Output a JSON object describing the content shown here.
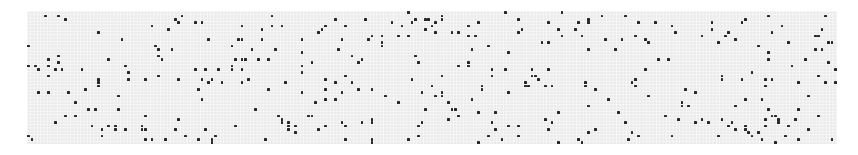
{
  "board": {
    "columns": 243,
    "rows": 40,
    "cell_size_px": 3.333,
    "background_color": "#ebebeb",
    "live_color": "#262626",
    "page_color": "#ffffff"
  },
  "live_cells": [
    [
      5,
      1
    ],
    [
      9,
      1
    ],
    [
      11,
      2
    ],
    [
      21,
      6
    ],
    [
      28,
      8
    ],
    [
      37,
      4
    ],
    [
      44,
      2
    ],
    [
      45,
      3
    ],
    [
      46,
      1
    ],
    [
      50,
      3
    ],
    [
      52,
      3
    ],
    [
      42,
      5
    ],
    [
      54,
      8
    ],
    [
      64,
      4
    ],
    [
      70,
      5
    ],
    [
      73,
      1
    ],
    [
      73,
      4
    ],
    [
      76,
      4
    ],
    [
      0,
      10
    ],
    [
      38,
      10
    ],
    [
      39,
      11
    ],
    [
      43,
      11
    ],
    [
      61,
      10
    ],
    [
      63,
      8
    ],
    [
      64,
      8
    ],
    [
      70,
      8
    ],
    [
      74,
      11
    ],
    [
      67,
      11
    ],
    [
      0,
      16
    ],
    [
      2,
      16
    ],
    [
      3,
      17
    ],
    [
      6,
      14
    ],
    [
      9,
      13
    ],
    [
      9,
      15
    ],
    [
      6,
      16
    ],
    [
      8,
      17
    ],
    [
      10,
      17
    ],
    [
      16,
      17
    ],
    [
      24,
      14
    ],
    [
      29,
      16
    ],
    [
      30,
      18
    ],
    [
      39,
      13
    ],
    [
      40,
      14
    ],
    [
      50,
      17
    ],
    [
      53,
      17
    ],
    [
      57,
      17
    ],
    [
      61,
      16
    ],
    [
      61,
      17
    ],
    [
      62,
      14
    ],
    [
      64,
      14
    ],
    [
      65,
      14
    ],
    [
      64,
      17
    ],
    [
      69,
      14
    ],
    [
      72,
      14
    ],
    [
      6,
      19
    ],
    [
      21,
      20
    ],
    [
      21,
      21
    ],
    [
      21,
      22
    ],
    [
      30,
      20
    ],
    [
      35,
      20
    ],
    [
      39,
      19
    ],
    [
      45,
      20
    ],
    [
      55,
      20
    ],
    [
      52,
      20
    ],
    [
      54,
      21
    ],
    [
      58,
      21
    ],
    [
      64,
      21
    ],
    [
      66,
      20
    ],
    [
      77,
      21
    ],
    [
      51,
      23
    ],
    [
      72,
      23
    ],
    [
      17,
      23
    ],
    [
      3,
      24
    ],
    [
      6,
      24
    ],
    [
      12,
      24
    ],
    [
      27,
      25
    ],
    [
      52,
      26
    ],
    [
      14,
      27
    ],
    [
      18,
      29
    ],
    [
      20,
      29
    ],
    [
      27,
      29
    ],
    [
      68,
      29
    ],
    [
      11,
      31
    ],
    [
      14,
      31
    ],
    [
      35,
      31
    ],
    [
      45,
      32
    ],
    [
      75,
      31
    ],
    [
      76,
      33
    ],
    [
      8,
      33
    ],
    [
      19,
      34
    ],
    [
      24,
      34
    ],
    [
      26,
      34
    ],
    [
      26,
      35
    ],
    [
      22,
      35
    ],
    [
      29,
      35
    ],
    [
      34,
      34
    ],
    [
      34,
      35
    ],
    [
      35,
      35
    ],
    [
      44,
      35
    ],
    [
      53,
      35
    ],
    [
      62,
      34
    ],
    [
      78,
      34
    ],
    [
      78,
      35
    ],
    [
      56,
      37
    ],
    [
      22,
      37
    ],
    [
      0,
      37
    ],
    [
      1,
      38
    ],
    [
      23,
      40
    ],
    [
      35,
      38
    ],
    [
      37,
      38
    ],
    [
      41,
      38
    ],
    [
      47,
      37
    ],
    [
      51,
      38
    ],
    [
      55,
      38
    ],
    [
      55,
      39
    ],
    [
      71,
      38
    ],
    [
      92,
      2
    ],
    [
      101,
      2
    ],
    [
      114,
      0
    ],
    [
      116,
      2
    ],
    [
      119,
      2
    ],
    [
      120,
      2
    ],
    [
      124,
      1
    ],
    [
      124,
      2
    ],
    [
      109,
      3
    ],
    [
      112,
      4
    ],
    [
      115,
      3
    ],
    [
      121,
      4
    ],
    [
      122,
      3
    ],
    [
      119,
      5
    ],
    [
      122,
      6
    ],
    [
      127,
      6
    ],
    [
      129,
      6
    ],
    [
      132,
      4
    ],
    [
      135,
      3
    ],
    [
      143,
      0
    ],
    [
      147,
      2
    ],
    [
      156,
      3
    ],
    [
      160,
      0
    ],
    [
      159,
      5
    ],
    [
      160,
      7
    ],
    [
      148,
      5
    ],
    [
      147,
      6
    ],
    [
      89,
      4
    ],
    [
      88,
      5
    ],
    [
      87,
      6
    ],
    [
      95,
      4
    ],
    [
      82,
      8
    ],
    [
      94,
      8
    ],
    [
      103,
      7
    ],
    [
      102,
      8
    ],
    [
      106,
      7
    ],
    [
      106,
      9
    ],
    [
      106,
      10
    ],
    [
      111,
      7
    ],
    [
      114,
      7
    ],
    [
      132,
      7
    ],
    [
      134,
      7
    ],
    [
      133,
      11
    ],
    [
      138,
      10
    ],
    [
      144,
      12
    ],
    [
      154,
      9
    ],
    [
      156,
      9
    ],
    [
      82,
      12
    ],
    [
      93,
      11
    ],
    [
      97,
      13
    ],
    [
      100,
      14
    ],
    [
      99,
      15
    ],
    [
      116,
      13
    ],
    [
      117,
      15
    ],
    [
      129,
      16
    ],
    [
      132,
      16
    ],
    [
      132,
      15
    ],
    [
      82,
      16
    ],
    [
      85,
      15
    ],
    [
      82,
      18
    ],
    [
      139,
      17
    ],
    [
      139,
      19
    ],
    [
      143,
      17
    ],
    [
      151,
      17
    ],
    [
      151,
      19
    ],
    [
      152,
      19
    ],
    [
      153,
      20
    ],
    [
      156,
      17
    ],
    [
      77,
      21
    ],
    [
      89,
      20
    ],
    [
      92,
      21
    ],
    [
      95,
      19
    ],
    [
      97,
      21
    ],
    [
      115,
      20
    ],
    [
      124,
      19
    ],
    [
      121,
      22
    ],
    [
      149,
      21
    ],
    [
      149,
      22
    ],
    [
      150,
      22
    ],
    [
      155,
      22
    ],
    [
      157,
      22
    ],
    [
      136,
      22
    ],
    [
      136,
      23
    ],
    [
      89,
      23
    ],
    [
      94,
      24
    ],
    [
      99,
      23
    ],
    [
      103,
      23
    ],
    [
      82,
      24
    ],
    [
      118,
      24
    ],
    [
      122,
      25
    ],
    [
      124,
      24
    ],
    [
      124,
      25
    ],
    [
      144,
      24
    ],
    [
      107,
      25
    ],
    [
      133,
      26
    ],
    [
      89,
      26
    ],
    [
      92,
      26
    ],
    [
      86,
      27
    ],
    [
      111,
      27
    ],
    [
      126,
      27
    ],
    [
      119,
      29
    ],
    [
      127,
      29
    ],
    [
      128,
      29
    ],
    [
      135,
      30
    ],
    [
      140,
      30
    ],
    [
      159,
      30
    ],
    [
      84,
      31
    ],
    [
      85,
      31
    ],
    [
      129,
      31
    ],
    [
      126,
      32
    ],
    [
      155,
      32
    ],
    [
      157,
      33
    ],
    [
      76,
      32
    ],
    [
      78,
      33
    ],
    [
      80,
      34
    ],
    [
      78,
      35
    ],
    [
      80,
      36
    ],
    [
      87,
      35
    ],
    [
      89,
      34
    ],
    [
      94,
      33
    ],
    [
      95,
      34
    ],
    [
      100,
      33
    ],
    [
      103,
      32
    ],
    [
      103,
      33
    ],
    [
      117,
      34
    ],
    [
      118,
      33
    ],
    [
      139,
      33
    ],
    [
      140,
      35
    ],
    [
      144,
      34
    ],
    [
      147,
      34
    ],
    [
      156,
      35
    ],
    [
      95,
      38
    ],
    [
      103,
      38
    ],
    [
      103,
      39
    ],
    [
      114,
      38
    ],
    [
      117,
      37
    ],
    [
      135,
      39
    ],
    [
      138,
      37
    ],
    [
      142,
      38
    ],
    [
      147,
      37
    ],
    [
      159,
      39
    ],
    [
      172,
      1
    ],
    [
      179,
      1
    ],
    [
      168,
      2
    ],
    [
      168,
      3
    ],
    [
      165,
      3
    ],
    [
      164,
      5
    ],
    [
      166,
      7
    ],
    [
      183,
      3
    ],
    [
      188,
      3
    ],
    [
      193,
      4
    ],
    [
      194,
      6
    ],
    [
      205,
      3
    ],
    [
      205,
      5
    ],
    [
      202,
      7
    ],
    [
      210,
      6
    ],
    [
      209,
      7
    ],
    [
      207,
      9
    ],
    [
      212,
      8
    ],
    [
      214,
      3
    ],
    [
      215,
      2
    ],
    [
      222,
      1
    ],
    [
      226,
      4
    ],
    [
      223,
      6
    ],
    [
      239,
      1
    ],
    [
      238,
      5
    ],
    [
      236,
      7
    ],
    [
      237,
      7
    ],
    [
      240,
      9
    ],
    [
      241,
      9
    ],
    [
      173,
      8
    ],
    [
      178,
      8
    ],
    [
      182,
      7
    ],
    [
      185,
      8
    ],
    [
      186,
      9
    ],
    [
      168,
      11
    ],
    [
      176,
      11
    ],
    [
      219,
      10
    ],
    [
      222,
      12
    ],
    [
      222,
      14
    ],
    [
      228,
      9
    ],
    [
      236,
      11
    ],
    [
      238,
      11
    ],
    [
      189,
      14
    ],
    [
      192,
      14
    ],
    [
      233,
      14
    ],
    [
      229,
      16
    ],
    [
      240,
      15
    ],
    [
      242,
      17
    ],
    [
      185,
      17
    ],
    [
      217,
      18
    ],
    [
      208,
      19
    ],
    [
      208,
      20
    ],
    [
      214,
      20
    ],
    [
      221,
      20
    ],
    [
      223,
      20
    ],
    [
      237,
      19
    ],
    [
      239,
      21
    ],
    [
      242,
      21
    ],
    [
      231,
      21
    ],
    [
      167,
      21
    ],
    [
      167,
      22
    ],
    [
      181,
      21
    ],
    [
      181,
      21
    ],
    [
      182,
      22
    ],
    [
      182,
      22
    ],
    [
      182,
      20
    ],
    [
      170,
      23
    ],
    [
      197,
      23
    ],
    [
      200,
      24
    ],
    [
      221,
      22
    ],
    [
      234,
      25
    ],
    [
      174,
      26
    ],
    [
      186,
      25
    ],
    [
      215,
      26
    ],
    [
      220,
      26
    ],
    [
      168,
      28
    ],
    [
      196,
      27
    ],
    [
      196,
      28
    ],
    [
      198,
      28
    ],
    [
      212,
      28
    ],
    [
      222,
      29
    ],
    [
      231,
      29
    ],
    [
      177,
      30
    ],
    [
      191,
      31
    ],
    [
      223,
      31
    ],
    [
      224,
      31
    ],
    [
      225,
      32
    ],
    [
      225,
      33
    ],
    [
      221,
      32
    ],
    [
      237,
      31
    ],
    [
      230,
      32
    ],
    [
      179,
      33
    ],
    [
      195,
      32
    ],
    [
      200,
      33
    ],
    [
      202,
      32
    ],
    [
      204,
      33
    ],
    [
      208,
      32
    ],
    [
      211,
      33
    ],
    [
      210,
      34
    ],
    [
      212,
      35
    ],
    [
      215,
      34
    ],
    [
      215,
      35
    ],
    [
      216,
      36
    ],
    [
      217,
      37
    ],
    [
      219,
      36
    ],
    [
      221,
      34
    ],
    [
      228,
      34
    ],
    [
      234,
      35
    ],
    [
      170,
      35
    ],
    [
      168,
      36
    ],
    [
      181,
      36
    ],
    [
      165,
      38
    ],
    [
      166,
      39
    ],
    [
      180,
      38
    ],
    [
      183,
      37
    ],
    [
      193,
      37
    ],
    [
      207,
      37
    ],
    [
      220,
      38
    ],
    [
      224,
      39
    ],
    [
      227,
      37
    ],
    [
      231,
      38
    ],
    [
      241,
      38
    ]
  ]
}
